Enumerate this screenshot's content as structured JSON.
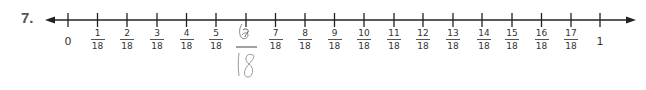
{
  "problem": {
    "number_label": "7.",
    "axis": {
      "start_label": "0",
      "end_label": "1",
      "denominator": "18",
      "fractions": [
        {
          "numerator": "1",
          "denominator": "18"
        },
        {
          "numerator": "2",
          "denominator": "18"
        },
        {
          "numerator": "3",
          "denominator": "18"
        },
        {
          "numerator": "4",
          "denominator": "18"
        },
        {
          "numerator": "5",
          "denominator": "18"
        },
        {
          "numerator": "6",
          "denominator": "18",
          "handwritten": true
        },
        {
          "numerator": "7",
          "denominator": "18"
        },
        {
          "numerator": "8",
          "denominator": "18"
        },
        {
          "numerator": "9",
          "denominator": "18"
        },
        {
          "numerator": "10",
          "denominator": "18"
        },
        {
          "numerator": "11",
          "denominator": "18"
        },
        {
          "numerator": "12",
          "denominator": "18"
        },
        {
          "numerator": "13",
          "denominator": "18"
        },
        {
          "numerator": "14",
          "denominator": "18"
        },
        {
          "numerator": "15",
          "denominator": "18"
        },
        {
          "numerator": "16",
          "denominator": "18"
        },
        {
          "numerator": "17",
          "denominator": "18"
        }
      ]
    },
    "handwritten_answer": {
      "numerator": "6",
      "denominator": "18"
    },
    "colors": {
      "line": "#222222",
      "text": "#333333",
      "pencil": "#9a9a9a"
    }
  }
}
